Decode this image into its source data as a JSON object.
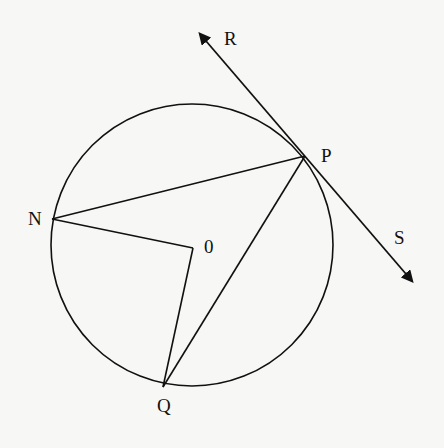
{
  "diagram": {
    "type": "circle-geometry",
    "colors": {
      "stroke": "#111111",
      "background": "#f7f7f5"
    },
    "circle": {
      "center": "0",
      "cx": 192,
      "cy": 245,
      "r": 141
    },
    "points": {
      "P": {
        "label": "P",
        "x": 305,
        "y": 156
      },
      "N": {
        "label": "N",
        "x": 52,
        "y": 219
      },
      "O": {
        "label": "0",
        "x": 193,
        "y": 248
      },
      "Q": {
        "label": "Q",
        "x": 163,
        "y": 387
      },
      "R": {
        "label": "R",
        "x": 193,
        "y": 27
      },
      "S": {
        "label": "S",
        "x": 418,
        "y": 287
      }
    },
    "segments": [
      {
        "from": "P",
        "to": "N"
      },
      {
        "from": "N",
        "to": "O"
      },
      {
        "from": "O",
        "to": "Q"
      },
      {
        "from": "Q",
        "to": "P"
      }
    ],
    "tangent": {
      "from": "R",
      "to": "S",
      "touches": "P",
      "arrows": [
        "R",
        "S"
      ]
    }
  }
}
